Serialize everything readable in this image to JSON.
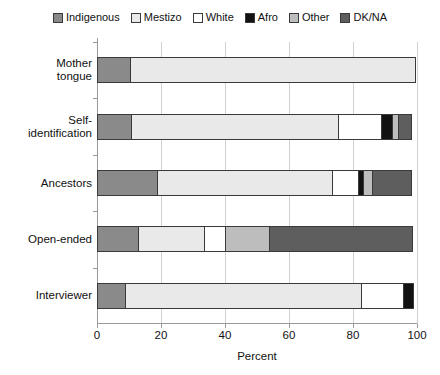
{
  "chart_data": {
    "type": "bar",
    "orientation": "horizontal",
    "stacked": true,
    "title": "",
    "xlabel": "Percent",
    "ylabel": "",
    "xlim": [
      0,
      100
    ],
    "xticks": [
      0,
      20,
      40,
      60,
      80,
      100
    ],
    "grid": true,
    "legend_position": "top",
    "categories": [
      "Mother tongue",
      "Self-identification",
      "Ancestors",
      "Open-ended",
      "Interviewer"
    ],
    "category_lines": [
      [
        "Mother",
        "tongue"
      ],
      [
        "Self-",
        "identification"
      ],
      [
        "Ancestors"
      ],
      [
        "Open-ended"
      ],
      [
        "Interviewer"
      ]
    ],
    "series": [
      {
        "name": "Indigenous",
        "color": "#8a8a8a",
        "values": [
          10.5,
          11.0,
          19.0,
          13.0,
          9.0
        ]
      },
      {
        "name": "Mestizo",
        "color": "#e9e9e9",
        "values": [
          89.5,
          65.0,
          55.0,
          21.0,
          74.0
        ]
      },
      {
        "name": "White",
        "color": "#ffffff",
        "values": [
          0.0,
          13.7,
          8.5,
          7.0,
          13.5
        ]
      },
      {
        "name": "Afro",
        "color": "#121212",
        "values": [
          0.0,
          3.7,
          1.9,
          0.0,
          3.5
        ]
      },
      {
        "name": "Other",
        "color": "#bdbdbd",
        "values": [
          0.0,
          2.1,
          3.1,
          14.0,
          0.0
        ]
      },
      {
        "name": "DK/NA",
        "color": "#5e5e5e",
        "values": [
          0.0,
          4.5,
          12.5,
          45.0,
          0.0
        ]
      }
    ]
  },
  "legend": {
    "items": [
      {
        "label": "Indigenous",
        "color": "#8a8a8a"
      },
      {
        "label": "Mestizo",
        "color": "#e9e9e9"
      },
      {
        "label": "White",
        "color": "#ffffff"
      },
      {
        "label": "Afro",
        "color": "#121212"
      },
      {
        "label": "Other",
        "color": "#bdbdbd"
      },
      {
        "label": "DK/NA",
        "color": "#5e5e5e"
      }
    ]
  },
  "axis": {
    "x_title": "Percent",
    "x_tick_labels": [
      "0",
      "20",
      "40",
      "60",
      "80",
      "100"
    ]
  }
}
